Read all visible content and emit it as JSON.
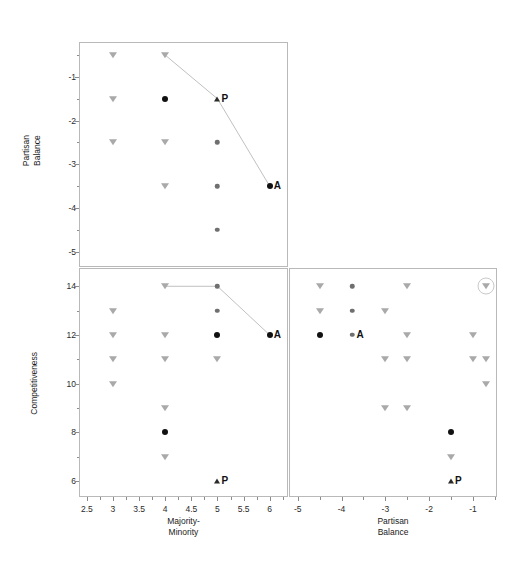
{
  "figure": {
    "type": "scatterplot-matrix",
    "width": 514,
    "height": 562,
    "background": "#ffffff",
    "line_color": "#c0c0c0",
    "marker_colors": {
      "triangle_down": "#a9a9a9",
      "triangle_up": "#2a2a2a",
      "filled_circle": "#111111",
      "small_circle": "#6f6f6f",
      "highlight_ring": "#c9c9c9"
    }
  },
  "axes": {
    "partisan_balance_y": {
      "label": "Partisan\nBalance",
      "ticks": [
        "-1",
        "-2",
        "-3",
        "-4",
        "-5"
      ],
      "values": [
        -1,
        -2,
        -3,
        -4,
        -5
      ],
      "range": [
        -5.35,
        -0.2
      ]
    },
    "competitiveness_y": {
      "label": "Competitiveness",
      "ticks": [
        "14",
        "12",
        "10",
        "8",
        "6"
      ],
      "values": [
        14,
        12,
        10,
        8,
        6
      ],
      "range": [
        5.35,
        14.75
      ]
    },
    "majority_minority_x": {
      "label": "Majority-\nMinority",
      "ticks": [
        "2.5",
        "3",
        "3.5",
        "4",
        "4.5",
        "5",
        "5.5",
        "6"
      ],
      "values": [
        2.5,
        3,
        3.5,
        4,
        4.5,
        5,
        5.5,
        6
      ],
      "range": [
        2.35,
        6.35
      ]
    },
    "partisan_balance_x": {
      "label": "Partisan\nBalance",
      "ticks": [
        "-5",
        "-4",
        "-3",
        "-2",
        "-1"
      ],
      "values": [
        -5,
        -4,
        -3,
        -2,
        -1
      ],
      "range": [
        -5.2,
        -0.45
      ]
    }
  },
  "chart_data": {
    "type": "scatter",
    "title": "",
    "panels": [
      {
        "id": "top-left",
        "name": "partisan-balance-vs-majority-minority",
        "xlabel": "Majority-Minority",
        "ylabel": "Partisan Balance",
        "xlim": [
          2.35,
          6.35
        ],
        "ylim": [
          -5.35,
          -0.2
        ],
        "grid": false,
        "points": [
          {
            "x": 3,
            "y": -0.5,
            "marker": "triangle-down"
          },
          {
            "x": 3,
            "y": -1.5,
            "marker": "triangle-down"
          },
          {
            "x": 3,
            "y": -2.5,
            "marker": "triangle-down"
          },
          {
            "x": 4,
            "y": -0.5,
            "marker": "triangle-down"
          },
          {
            "x": 4,
            "y": -1.5,
            "marker": "filled-circle"
          },
          {
            "x": 4,
            "y": -2.5,
            "marker": "triangle-down"
          },
          {
            "x": 4,
            "y": -3.5,
            "marker": "triangle-down"
          },
          {
            "x": 5,
            "y": -1.5,
            "marker": "triangle-up",
            "label": "P"
          },
          {
            "x": 5,
            "y": -2.5,
            "marker": "small-circle"
          },
          {
            "x": 5,
            "y": -3.5,
            "marker": "small-circle"
          },
          {
            "x": 5,
            "y": -4.5,
            "marker": "small-circle"
          },
          {
            "x": 6,
            "y": -3.5,
            "marker": "filled-circle",
            "label": "A"
          }
        ],
        "line": {
          "color": "#c0c0c0",
          "points": [
            [
              4,
              -0.5
            ],
            [
              5,
              -1.5
            ],
            [
              6,
              -3.5
            ]
          ]
        }
      },
      {
        "id": "bottom-left",
        "name": "competitiveness-vs-majority-minority",
        "xlabel": "Majority-Minority",
        "ylabel": "Competitiveness",
        "xlim": [
          2.35,
          6.35
        ],
        "ylim": [
          5.35,
          14.75
        ],
        "grid": false,
        "points": [
          {
            "x": 3,
            "y": 13,
            "marker": "triangle-down"
          },
          {
            "x": 3,
            "y": 12,
            "marker": "triangle-down"
          },
          {
            "x": 3,
            "y": 11,
            "marker": "triangle-down"
          },
          {
            "x": 3,
            "y": 10,
            "marker": "triangle-down"
          },
          {
            "x": 4,
            "y": 14,
            "marker": "triangle-down"
          },
          {
            "x": 4,
            "y": 12,
            "marker": "triangle-down"
          },
          {
            "x": 4,
            "y": 11,
            "marker": "triangle-down"
          },
          {
            "x": 4,
            "y": 9,
            "marker": "triangle-down"
          },
          {
            "x": 4,
            "y": 8,
            "marker": "filled-circle"
          },
          {
            "x": 4,
            "y": 7,
            "marker": "triangle-down"
          },
          {
            "x": 5,
            "y": 14,
            "marker": "small-circle"
          },
          {
            "x": 5,
            "y": 13,
            "marker": "small-circle"
          },
          {
            "x": 5,
            "y": 12,
            "marker": "filled-circle"
          },
          {
            "x": 5,
            "y": 11,
            "marker": "triangle-down"
          },
          {
            "x": 5,
            "y": 6,
            "marker": "triangle-up",
            "label": "P"
          },
          {
            "x": 6,
            "y": 12,
            "marker": "filled-circle",
            "label": "A"
          }
        ],
        "line": {
          "color": "#c0c0c0",
          "points": [
            [
              4,
              14
            ],
            [
              5,
              14
            ],
            [
              6,
              12
            ]
          ]
        }
      },
      {
        "id": "bottom-right",
        "name": "competitiveness-vs-partisan-balance",
        "xlabel": "Partisan Balance",
        "ylabel": "Competitiveness",
        "xlim": [
          -5.2,
          -0.45
        ],
        "ylim": [
          5.35,
          14.75
        ],
        "grid": false,
        "points": [
          {
            "x": -4.5,
            "y": 14,
            "marker": "triangle-down"
          },
          {
            "x": -4.5,
            "y": 13,
            "marker": "triangle-down"
          },
          {
            "x": -4.5,
            "y": 12,
            "marker": "filled-circle"
          },
          {
            "x": -3.75,
            "y": 14,
            "marker": "small-circle"
          },
          {
            "x": -3.75,
            "y": 13,
            "marker": "small-circle"
          },
          {
            "x": -3.75,
            "y": 12,
            "marker": "small-circle",
            "label": "A"
          },
          {
            "x": -3.0,
            "y": 13,
            "marker": "triangle-down"
          },
          {
            "x": -3.0,
            "y": 11,
            "marker": "triangle-down"
          },
          {
            "x": -3.0,
            "y": 9,
            "marker": "triangle-down"
          },
          {
            "x": -2.5,
            "y": 14,
            "marker": "triangle-down"
          },
          {
            "x": -2.5,
            "y": 12,
            "marker": "triangle-down"
          },
          {
            "x": -2.5,
            "y": 11,
            "marker": "triangle-down"
          },
          {
            "x": -2.5,
            "y": 9,
            "marker": "triangle-down"
          },
          {
            "x": -1.5,
            "y": 8,
            "marker": "filled-circle"
          },
          {
            "x": -1.5,
            "y": 7,
            "marker": "triangle-down"
          },
          {
            "x": -1.5,
            "y": 6,
            "marker": "triangle-up",
            "label": "P"
          },
          {
            "x": -1.0,
            "y": 12,
            "marker": "triangle-down"
          },
          {
            "x": -1.0,
            "y": 11,
            "marker": "triangle-down"
          },
          {
            "x": -0.7,
            "y": 14,
            "marker": "triangle-down",
            "highlight": true
          },
          {
            "x": -0.7,
            "y": 11,
            "marker": "triangle-down"
          },
          {
            "x": -0.7,
            "y": 10,
            "marker": "triangle-down"
          }
        ],
        "line": null
      }
    ],
    "annotations": [
      {
        "text": "A",
        "meaning": "series-A-endpoint"
      },
      {
        "text": "P",
        "meaning": "series-P-endpoint"
      }
    ]
  }
}
